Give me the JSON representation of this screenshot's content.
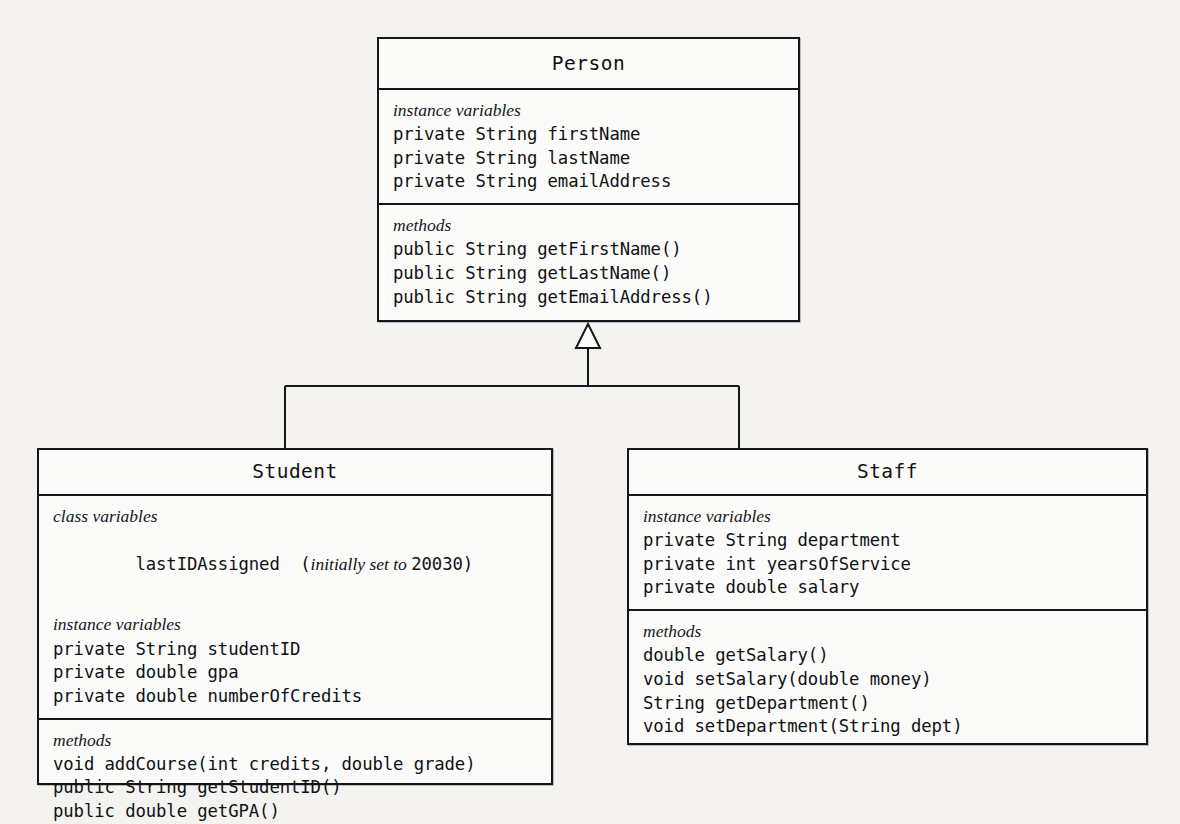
{
  "diagram": {
    "type": "uml-class-diagram",
    "relationship": "generalization",
    "relationship_arrow": "hollow-triangle-inheritance",
    "colors": {
      "background": "#f4f3f0",
      "box_fill": "#fbfbfa",
      "line": "#15161a",
      "text": "#101114"
    }
  },
  "classes": {
    "person": {
      "name": "Person",
      "compartments": [
        {
          "label": "instance variables",
          "lines": [
            "private String firstName",
            "private String lastName",
            "private String emailAddress"
          ]
        },
        {
          "label": "methods",
          "lines": [
            "public String getFirstName()",
            "public String getLastName()",
            "public String getEmailAddress()"
          ]
        }
      ]
    },
    "student": {
      "name": "Student",
      "compartments": [
        {
          "label": "class variables",
          "lines": [
            "lastIDAssigned  (initially set to 20030)"
          ],
          "mixed_line": {
            "code_prefix": "lastIDAssigned  (",
            "italic_part": "initially set to ",
            "code_suffix": "20030)"
          },
          "label2": "instance variables",
          "lines2": [
            "private String studentID",
            "private double gpa",
            "private double numberOfCredits"
          ]
        },
        {
          "label": "methods",
          "lines": [
            "void addCourse(int credits, double grade)",
            "public String getStudentID()",
            "public double getGPA()"
          ]
        }
      ]
    },
    "staff": {
      "name": "Staff",
      "compartments": [
        {
          "label": "instance variables",
          "lines": [
            "private String department",
            "private int yearsOfService",
            "private double salary"
          ]
        },
        {
          "label": "methods",
          "lines": [
            "double getSalary()",
            "void setSalary(double money)",
            "String getDepartment()",
            "void setDepartment(String dept)"
          ]
        }
      ]
    }
  }
}
